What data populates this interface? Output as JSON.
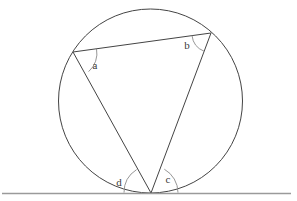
{
  "figure": {
    "kind": "circle-geometry-diagram",
    "width": 297,
    "height": 201,
    "background_color": "#ffffff",
    "stroke_color": "#444444",
    "arc_color": "#7a7a7a",
    "tangent_color": "#9a9a9a",
    "label_color": "#3a3a3a"
  },
  "circle": {
    "name": "main-circle",
    "cx": 150.5,
    "cy": 101,
    "r": 92,
    "stroke_width": 1
  },
  "points": {
    "a_vertex": {
      "label": "A",
      "x": 73,
      "y": 52
    },
    "b_vertex": {
      "label": "B",
      "x": 211,
      "y": 33
    },
    "apex": {
      "label": "P",
      "x": 151,
      "y": 193
    }
  },
  "segments": [
    {
      "name": "chord-ab",
      "x1": 73,
      "y1": 52,
      "x2": 211,
      "y2": 33
    },
    {
      "name": "chord-a-apex",
      "x1": 73,
      "y1": 52,
      "x2": 151,
      "y2": 193
    },
    {
      "name": "chord-b-apex",
      "x1": 211,
      "y1": 33,
      "x2": 151,
      "y2": 193
    }
  ],
  "tangent_line": {
    "name": "tangent-line",
    "x1": 2,
    "y1": 193.5,
    "x2": 291,
    "y2": 193.5,
    "stroke_width": 1.2
  },
  "angle_marks": [
    {
      "id": "angle-a",
      "label": "a",
      "vertex": "a_vertex",
      "arc_path": "M 96.5 48.8 A 24 24 0 0 1 88.6 71.6",
      "label_x": 95,
      "label_y": 69
    },
    {
      "id": "angle-b",
      "label": "b",
      "vertex": "b_vertex",
      "arc_path": "M 192.0 35.6 A 19.2 19.2 0 0 0 204.0 51.2",
      "label_x": 187,
      "label_y": 49
    },
    {
      "id": "angle-c",
      "label": "c",
      "vertex": "apex",
      "arc_path": "M 178.0 192.6 A 27 27 0 0 0 164.3 169.2",
      "label_x": 168,
      "label_y": 183
    },
    {
      "id": "angle-d",
      "label": "d",
      "vertex": "apex",
      "arc_path": "M 124.0 192.6 A 27 27 0 0 1 136.6 169.6",
      "label_x": 119,
      "label_y": 186
    }
  ]
}
